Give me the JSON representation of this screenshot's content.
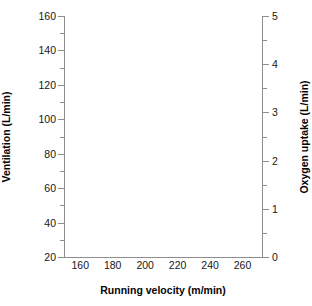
{
  "chart_data": {
    "type": "line",
    "title": "",
    "subtitle": "",
    "series": [],
    "annotations": [],
    "grid": false,
    "legend": null,
    "x_axis": {
      "label": "Running velocity (m/min)",
      "ticks": [
        160,
        180,
        200,
        220,
        240,
        260
      ],
      "ticklabels": [
        "160",
        "180",
        "200",
        "220",
        "240",
        "260"
      ],
      "lim": [
        150,
        272
      ],
      "tickmarks_visible": false
    },
    "y_axis_left": {
      "label": "Ventilation (L/min)",
      "ticks": [
        20,
        40,
        60,
        80,
        100,
        120,
        140,
        160
      ],
      "ticklabels": [
        "20",
        "40",
        "60",
        "80",
        "100",
        "120",
        "140",
        "160"
      ],
      "minor_ticks": [
        30,
        50,
        70,
        90,
        110,
        130,
        150
      ],
      "lim": [
        20,
        160
      ],
      "tick_direction": "out"
    },
    "y_axis_right": {
      "label": "Oxygen uptake (L/min)",
      "ticks": [
        0,
        1,
        2,
        3,
        4,
        5
      ],
      "ticklabels": [
        "0",
        "1",
        "2",
        "3",
        "4",
        "5"
      ],
      "minor_ticks": [
        0.5,
        1.5,
        2.5,
        3.5,
        4.5
      ],
      "lim": [
        0,
        5
      ],
      "tick_direction": "out"
    }
  },
  "colors": {
    "axis": "#8d8d8d",
    "text": "#171717",
    "title_text": "#050505",
    "plot_background": "#ffffff"
  }
}
